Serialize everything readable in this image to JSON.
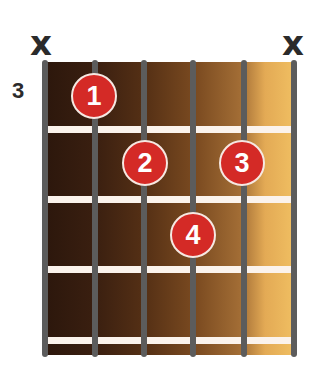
{
  "chord_diagram": {
    "start_fret_label": "3",
    "string_markers": [
      {
        "string": 6,
        "marker": "x"
      },
      {
        "string": 1,
        "marker": "x"
      }
    ],
    "fingers": [
      {
        "finger": "1",
        "string": 5,
        "fret": 1
      },
      {
        "finger": "2",
        "string": 4,
        "fret": 2
      },
      {
        "finger": "3",
        "string": 2,
        "fret": 2
      },
      {
        "finger": "4",
        "string": 3,
        "fret": 3
      }
    ],
    "num_strings": 6,
    "num_frets_shown": 4,
    "colors": {
      "dot": "#d42a26",
      "string": "#5c5c5c",
      "fret": "#fbf3ec",
      "board_dark": "#2c170c",
      "board_light": "#f0bf62"
    }
  }
}
